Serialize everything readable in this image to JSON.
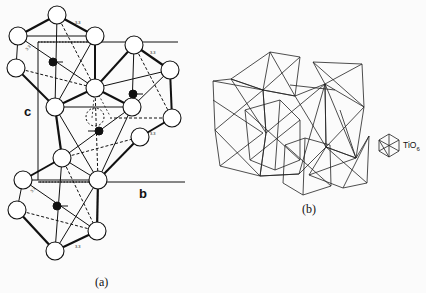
{
  "figure": {
    "panel_a": {
      "caption": "(a)",
      "axis_c": "c",
      "axis_b": "b",
      "bond_label": "3.3",
      "description": "Octahedral clusters with central atoms and displacement arrows, unit cell edges c and b"
    },
    "panel_b": {
      "caption": "(b)",
      "legend_label": "TiO",
      "legend_sub": "6",
      "legend_icon": "octahedron-icon",
      "description": "Polyhedral network of corner/edge-sharing TiO6 octahedra"
    }
  }
}
